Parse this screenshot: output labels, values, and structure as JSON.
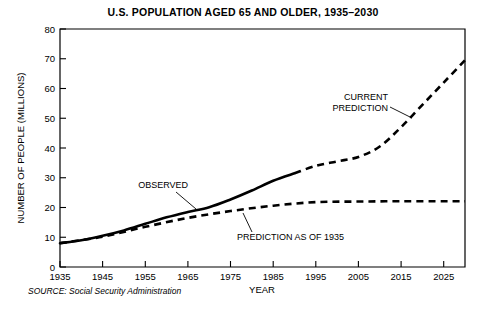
{
  "chart_data": {
    "type": "line",
    "title": "U.S. POPULATION AGED 65 AND OLDER, 1935–2030",
    "xlabel": "YEAR",
    "ylabel": "NUMBER OF PEOPLE (MILLIONS)",
    "xlim": [
      1935,
      2030
    ],
    "ylim": [
      0,
      80
    ],
    "grid": false,
    "legend_position": "inline-annotations",
    "xticks": [
      1935,
      1945,
      1955,
      1965,
      1975,
      1985,
      1995,
      2005,
      2015,
      2025
    ],
    "xtick_labels": [
      "1935",
      "1945",
      "1955",
      "1965",
      "1975",
      "1985",
      "1995",
      "2005",
      "2015",
      "2025"
    ],
    "yticks": [
      0,
      10,
      20,
      30,
      40,
      50,
      60,
      70,
      80
    ],
    "ytick_labels": [
      "0",
      "10",
      "20",
      "30",
      "40",
      "50",
      "60",
      "70",
      "80"
    ],
    "series": [
      {
        "name": "OBSERVED",
        "style": "solid",
        "x": [
          1935,
          1940,
          1945,
          1950,
          1955,
          1960,
          1965,
          1970,
          1975,
          1980,
          1985,
          1990
        ],
        "values": [
          8.0,
          9.0,
          10.5,
          12.3,
          14.5,
          16.7,
          18.5,
          20.1,
          22.7,
          25.7,
          29.0,
          31.5
        ]
      },
      {
        "name": "CURRENT PREDICTION",
        "style": "dashed",
        "x": [
          1990,
          1995,
          2000,
          2005,
          2010,
          2015,
          2020,
          2025,
          2030
        ],
        "values": [
          31.5,
          34.0,
          35.5,
          37.0,
          40.5,
          47.0,
          54.5,
          62.0,
          69.5
        ]
      },
      {
        "name": "PREDICTION AS OF 1935",
        "style": "dashed",
        "x": [
          1935,
          1945,
          1955,
          1965,
          1975,
          1985,
          1995,
          2005,
          2015,
          2025,
          2030
        ],
        "values": [
          8.0,
          10.2,
          13.5,
          16.5,
          18.8,
          20.6,
          21.8,
          22.0,
          22.1,
          22.1,
          22.1
        ]
      }
    ],
    "annotations": [
      {
        "text": "OBSERVED",
        "label_x": 1948,
        "label_y": 27.5
      },
      {
        "text": "CURRENT PREDICTION",
        "line1": "CURRENT",
        "line2": "PREDICTION",
        "label_x": 1996,
        "label_y": 57
      },
      {
        "text": "PREDICTION AS OF 1935",
        "label_x": 1975,
        "label_y": 11.5
      }
    ],
    "source": "SOURCE: Social Security Administration"
  }
}
